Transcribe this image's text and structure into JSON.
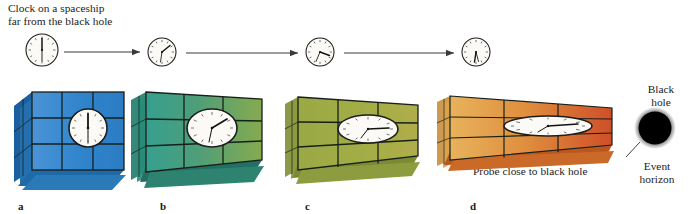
{
  "figure": {
    "background": "#ffffff",
    "width": 696,
    "height": 214
  },
  "captions": {
    "spaceship_clock_line1": "Clock on a spaceship",
    "spaceship_clock_line2": "far from the black hole",
    "probe": "Probe close to black hole",
    "black_hole_line1": "Black",
    "black_hole_line2": "hole",
    "event_horizon_line1": "Event",
    "event_horizon_line2": "horizon"
  },
  "panels": [
    {
      "letter": "a",
      "color_main": "#2f84cc",
      "color_dark": "#1b5f9e",
      "color_light": "#63a6de",
      "clock_time": "12:00",
      "clock_shape": "circle",
      "flatten": 1.0
    },
    {
      "letter": "b",
      "color_main": "#3f9e8c",
      "color_dark": "#1f7b6b",
      "color_light": "#7fae5e",
      "clock_time": "1:30",
      "clock_shape": "ellipse-wide",
      "flatten": 0.74
    },
    {
      "letter": "c",
      "color_main": "#97a843",
      "color_dark": "#7e8e35",
      "color_light": "#b5bf63",
      "clock_time": "3:00",
      "clock_shape": "ellipse-flat",
      "flatten": 0.42
    },
    {
      "letter": "d",
      "color_main": "#dd8a3c",
      "color_dark": "#c2622a",
      "color_light": "#e8b45f",
      "clock_time": "4:30",
      "clock_shape": "ellipse-very-flat",
      "flatten": 0.22
    }
  ],
  "top_clocks": [
    {
      "name": "clock-far",
      "time": "12:00",
      "cx": 42,
      "cy": 50,
      "r": 16
    },
    {
      "name": "clock-mid-1",
      "time": "1:30",
      "cx": 162,
      "cy": 52,
      "r": 14
    },
    {
      "name": "clock-mid-2",
      "time": "3:00",
      "cx": 320,
      "cy": 52,
      "r": 14
    },
    {
      "name": "clock-near",
      "time": "5:30",
      "cx": 476,
      "cy": 52,
      "r": 14
    }
  ],
  "arrows": [
    {
      "name": "arrow-1",
      "x1": 64,
      "y1": 52,
      "x2": 142,
      "y2": 52
    },
    {
      "name": "arrow-2",
      "x1": 186,
      "y1": 53,
      "x2": 300,
      "y2": 53
    },
    {
      "name": "arrow-3",
      "x1": 344,
      "y1": 53,
      "x2": 456,
      "y2": 53
    }
  ],
  "black_hole": {
    "cx": 655,
    "cy": 128,
    "r": 17,
    "color": "#000000",
    "leader_from_x": 639,
    "leader_from_y": 143,
    "leader_to_x": 624,
    "leader_to_y": 158
  }
}
